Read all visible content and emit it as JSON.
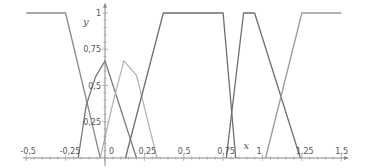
{
  "chart_data": {
    "type": "line",
    "title": "",
    "xlabel": "x",
    "ylabel": "y",
    "xlim": [
      -0.55,
      1.55
    ],
    "ylim": [
      0,
      1.05
    ],
    "grid": false,
    "legend": null,
    "x_ticks": [
      {
        "value": -0.5,
        "label": "-0,5"
      },
      {
        "value": -0.25,
        "label": "-0,25"
      },
      {
        "value": 0,
        "label": "0"
      },
      {
        "value": 0.25,
        "label": "0,25"
      },
      {
        "value": 0.5,
        "label": "0,5"
      },
      {
        "value": 0.75,
        "label": "0,75"
      },
      {
        "value": 1,
        "label": "1"
      },
      {
        "value": 1.25,
        "label": "1,25"
      },
      {
        "value": 1.5,
        "label": "1,5"
      }
    ],
    "y_ticks": [
      {
        "value": 0.25,
        "label": "0,25"
      },
      {
        "value": 0.5,
        "label": "0,5"
      },
      {
        "value": 0.75,
        "label": "0,75"
      },
      {
        "value": 1,
        "label": "1"
      }
    ],
    "series": [
      {
        "name": "left-shoulder",
        "color": "#8a8a8a",
        "points": [
          [
            -0.5,
            1
          ],
          [
            -0.25,
            1
          ],
          [
            -0.03,
            0
          ]
        ]
      },
      {
        "name": "triangle-neg",
        "color": "#7a7a7a",
        "points": [
          [
            -0.17,
            0
          ],
          [
            -0.12,
            0.36
          ],
          [
            -0.06,
            0.56
          ],
          [
            0,
            0.67
          ],
          [
            0.2,
            0
          ]
        ]
      },
      {
        "name": "triangle-pos",
        "color": "#b5b5b5",
        "points": [
          [
            -0.03,
            0
          ],
          [
            0.05,
            0.38
          ],
          [
            0.12,
            0.67
          ],
          [
            0.2,
            0.57
          ],
          [
            0.33,
            0
          ]
        ]
      },
      {
        "name": "trapezoid-mid",
        "color": "#6e6e6e",
        "points": [
          [
            0.13,
            0
          ],
          [
            0.37,
            1
          ],
          [
            0.75,
            1
          ],
          [
            0.83,
            0
          ]
        ]
      },
      {
        "name": "trapezoid-right",
        "color": "#6e6e6e",
        "points": [
          [
            0.77,
            0
          ],
          [
            0.88,
            1
          ],
          [
            0.95,
            1
          ],
          [
            1.24,
            0
          ]
        ]
      },
      {
        "name": "right-shoulder",
        "color": "#9a9a9a",
        "points": [
          [
            1.02,
            0
          ],
          [
            1.25,
            1
          ],
          [
            1.5,
            1
          ]
        ]
      }
    ]
  }
}
